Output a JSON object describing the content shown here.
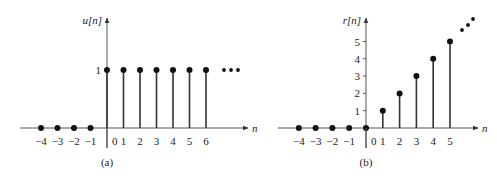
{
  "chart_data": [
    {
      "type": "stem",
      "title": "",
      "caption": "(a)",
      "ylabel": "u[n]",
      "xlabel": "n",
      "x": [
        -4,
        -3,
        -2,
        -1,
        0,
        1,
        2,
        3,
        4,
        5,
        6
      ],
      "values": [
        0,
        0,
        0,
        0,
        1,
        1,
        1,
        1,
        1,
        1,
        1
      ],
      "x_tick_labels": [
        "−4",
        "−3",
        "−2",
        "−1",
        "0",
        "1",
        "2",
        "3",
        "4",
        "5",
        "6"
      ],
      "y_tick_labels": [
        "1"
      ],
      "continuation": "• • •",
      "grid": false
    },
    {
      "type": "stem",
      "title": "",
      "caption": "(b)",
      "ylabel": "r[n]",
      "xlabel": "n",
      "x": [
        -4,
        -3,
        -2,
        -1,
        0,
        1,
        2,
        3,
        4,
        5
      ],
      "values": [
        0,
        0,
        0,
        0,
        0,
        1,
        2,
        3,
        4,
        5
      ],
      "x_tick_labels": [
        "−4",
        "−3",
        "−2",
        "−1",
        "0",
        "1",
        "2",
        "3",
        "4",
        "5"
      ],
      "y_tick_labels": [
        "1",
        "2",
        "3",
        "4",
        "5"
      ],
      "continuation": "• • •",
      "grid": false
    }
  ]
}
